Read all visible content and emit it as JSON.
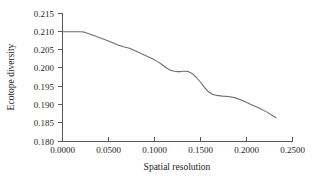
{
  "chart_data": {
    "type": "line",
    "title": "",
    "xlabel": "Spatial resolution",
    "ylabel": "Ecotope diversity",
    "xlim": [
      0.0,
      0.25
    ],
    "ylim": [
      0.18,
      0.215
    ],
    "grid": false,
    "legend": null,
    "xticks": [
      0.0,
      0.05,
      0.1,
      0.15,
      0.2,
      0.25
    ],
    "xtick_labels": [
      "0.0000",
      "0.0500",
      "0.1000",
      "0.1500",
      "0.2000",
      "0.2500"
    ],
    "yticks": [
      0.18,
      0.185,
      0.19,
      0.195,
      0.2,
      0.205,
      0.21,
      0.215
    ],
    "ytick_labels": [
      "0.180",
      "0.185",
      "0.190",
      "0.195",
      "0.200",
      "0.205",
      "0.210",
      "0.215"
    ],
    "series": [
      {
        "name": "Ecotope diversity",
        "color": "#6d6e71",
        "x": [
          0.0,
          0.0109,
          0.0196,
          0.0239,
          0.0304,
          0.037,
          0.0435,
          0.05,
          0.0554,
          0.0609,
          0.0663,
          0.0728,
          0.0783,
          0.0848,
          0.0913,
          0.0978,
          0.1043,
          0.1087,
          0.113,
          0.1174,
          0.1217,
          0.125,
          0.1283,
          0.1304,
          0.1337,
          0.137,
          0.1413,
          0.1457,
          0.15,
          0.1543,
          0.1587,
          0.163,
          0.1674,
          0.1739,
          0.1804,
          0.187,
          0.1957,
          0.2043,
          0.213,
          0.2217,
          0.232
        ],
        "y": [
          0.21,
          0.21,
          0.21,
          0.2099,
          0.2093,
          0.2087,
          0.2081,
          0.2075,
          0.2069,
          0.2063,
          0.2059,
          0.2055,
          0.2049,
          0.2041,
          0.2034,
          0.2026,
          0.2017,
          0.2009,
          0.2001,
          0.1995,
          0.1992,
          0.1991,
          0.1991,
          0.1992,
          0.1992,
          0.1991,
          0.1985,
          0.1975,
          0.1962,
          0.1948,
          0.1936,
          0.1929,
          0.1926,
          0.1924,
          0.1923,
          0.192,
          0.1912,
          0.1902,
          0.1892,
          0.1881,
          0.1865
        ]
      }
    ]
  },
  "axes": {
    "x_title": "Spatial resolution",
    "y_title": "Ecotope diversity",
    "x_tick_labels": [
      "0.0000",
      "0.0500",
      "0.1000",
      "0.1500",
      "0.2000",
      "0.2500"
    ],
    "y_tick_labels": [
      "0.215",
      "0.210",
      "0.205",
      "0.200",
      "0.195",
      "0.190",
      "0.185",
      "0.180"
    ]
  },
  "colors": {
    "line": "#6d6e71",
    "axis": "#58595b",
    "text": "#231f20",
    "background": "#ffffff"
  }
}
